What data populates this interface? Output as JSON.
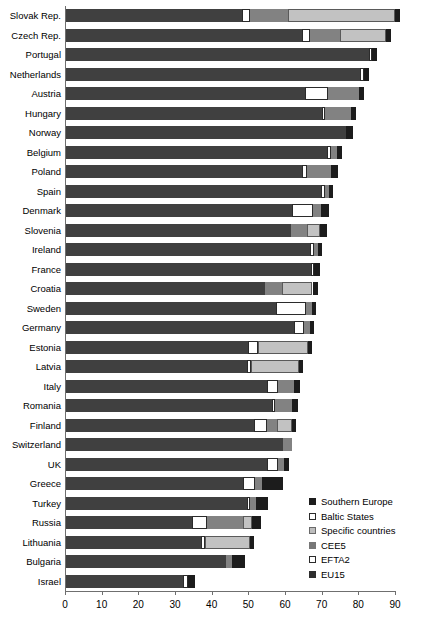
{
  "chart_data": {
    "type": "bar",
    "orientation": "horizontal",
    "stacked": true,
    "title": "",
    "xlabel": "",
    "ylabel": "",
    "xlim": [
      0,
      90
    ],
    "xticks": [
      0,
      10,
      20,
      30,
      40,
      50,
      60,
      70,
      80,
      90
    ],
    "grid": false,
    "legend_position": "inside-bottom-right",
    "series": [
      {
        "name": "EU15",
        "key": "EU15",
        "color": "#404040"
      },
      {
        "name": "EFTA2",
        "key": "EFTA2",
        "color": "#ffffff"
      },
      {
        "name": "CEE5",
        "key": "CEE5",
        "color": "#828282"
      },
      {
        "name": "Specific countries",
        "key": "specific",
        "color": "#c2c2c2"
      },
      {
        "name": "Baltic States",
        "key": "baltic",
        "color": "#ffffff"
      },
      {
        "name": "Southern Europe",
        "key": "southern",
        "color": "#1c1c1c"
      }
    ],
    "categories": [
      "Slovak Rep.",
      "Czech Rep.",
      "Portugal",
      "Netherlands",
      "Austria",
      "Hungary",
      "Norway",
      "Belgium",
      "Poland",
      "Spain",
      "Denmark",
      "Slovenia",
      "Ireland",
      "France",
      "Croatia",
      "Sweden",
      "Germany",
      "Estonia",
      "Latvia",
      "Italy",
      "Romania",
      "Finland",
      "Switzerland",
      "UK",
      "Greece",
      "Turkey",
      "Russia",
      "Lithuania",
      "Bulgaria",
      "Israel"
    ],
    "rows": [
      {
        "category": "Slovak Rep.",
        "total": 91.5,
        "segments": [
          {
            "key": "EU15",
            "value": 48.3
          },
          {
            "key": "EFTA2",
            "value": 2.2
          },
          {
            "key": "CEE5",
            "value": 10.4
          },
          {
            "key": "specific",
            "value": 29.2
          },
          {
            "key": "southern",
            "value": 1.4
          }
        ]
      },
      {
        "category": "Czech Rep.",
        "total": 89.0,
        "segments": [
          {
            "key": "EU15",
            "value": 64.6
          },
          {
            "key": "EFTA2",
            "value": 2.2
          },
          {
            "key": "CEE5",
            "value": 8.2
          },
          {
            "key": "specific",
            "value": 12.6
          },
          {
            "key": "southern",
            "value": 1.4
          }
        ]
      },
      {
        "category": "Portugal",
        "total": 85.0,
        "segments": [
          {
            "key": "EU15",
            "value": 83.0
          },
          {
            "key": "EFTA2",
            "value": 0.8
          },
          {
            "key": "southern",
            "value": 1.2
          }
        ]
      },
      {
        "category": "Netherlands",
        "total": 83.0,
        "segments": [
          {
            "key": "EU15",
            "value": 80.5
          },
          {
            "key": "EFTA2",
            "value": 1.1
          },
          {
            "key": "southern",
            "value": 1.4
          }
        ]
      },
      {
        "category": "Austria",
        "total": 81.5,
        "segments": [
          {
            "key": "EU15",
            "value": 65.5
          },
          {
            "key": "EFTA2",
            "value": 6.3
          },
          {
            "key": "CEE5",
            "value": 8.3
          },
          {
            "key": "southern",
            "value": 1.4
          }
        ]
      },
      {
        "category": "Hungary",
        "total": 79.5,
        "segments": [
          {
            "key": "EU15",
            "value": 70.0
          },
          {
            "key": "EFTA2",
            "value": 1.0
          },
          {
            "key": "CEE5",
            "value": 7.1
          },
          {
            "key": "southern",
            "value": 1.4
          }
        ]
      },
      {
        "category": "Norway",
        "total": 78.5,
        "segments": [
          {
            "key": "EU15",
            "value": 76.5
          },
          {
            "key": "southern",
            "value": 2.0
          }
        ]
      },
      {
        "category": "Belgium",
        "total": 75.5,
        "segments": [
          {
            "key": "EU15",
            "value": 71.5
          },
          {
            "key": "EFTA2",
            "value": 1.1
          },
          {
            "key": "CEE5",
            "value": 1.6
          },
          {
            "key": "southern",
            "value": 1.3
          }
        ]
      },
      {
        "category": "Poland",
        "total": 74.5,
        "segments": [
          {
            "key": "EU15",
            "value": 64.6
          },
          {
            "key": "EFTA2",
            "value": 1.4
          },
          {
            "key": "CEE5",
            "value": 6.5
          },
          {
            "key": "southern",
            "value": 2.0
          }
        ]
      },
      {
        "category": "Spain",
        "total": 73.0,
        "segments": [
          {
            "key": "EU15",
            "value": 69.8
          },
          {
            "key": "EFTA2",
            "value": 1.1
          },
          {
            "key": "CEE5",
            "value": 1.0
          },
          {
            "key": "southern",
            "value": 1.1
          }
        ]
      },
      {
        "category": "Denmark",
        "total": 72.0,
        "segments": [
          {
            "key": "EU15",
            "value": 62.0
          },
          {
            "key": "EFTA2",
            "value": 5.6
          },
          {
            "key": "CEE5",
            "value": 2.3
          },
          {
            "key": "southern",
            "value": 2.1
          }
        ]
      },
      {
        "category": "Slovenia",
        "total": 71.5,
        "segments": [
          {
            "key": "EU15",
            "value": 61.5
          },
          {
            "key": "CEE5",
            "value": 4.6
          },
          {
            "key": "specific",
            "value": 3.5
          },
          {
            "key": "southern",
            "value": 1.9
          }
        ]
      },
      {
        "category": "Ireland",
        "total": 70.0,
        "segments": [
          {
            "key": "EU15",
            "value": 66.8
          },
          {
            "key": "EFTA2",
            "value": 1.1
          },
          {
            "key": "CEE5",
            "value": 1.0
          },
          {
            "key": "southern",
            "value": 1.1
          }
        ]
      },
      {
        "category": "France",
        "total": 69.5,
        "segments": [
          {
            "key": "EU15",
            "value": 67.0
          },
          {
            "key": "EFTA2",
            "value": 1.0
          },
          {
            "key": "southern",
            "value": 1.5
          }
        ]
      },
      {
        "category": "Croatia",
        "total": 69.0,
        "segments": [
          {
            "key": "EU15",
            "value": 54.5
          },
          {
            "key": "CEE5",
            "value": 4.7
          },
          {
            "key": "specific",
            "value": 8.3
          },
          {
            "key": "southern",
            "value": 1.5
          }
        ]
      },
      {
        "category": "Sweden",
        "total": 68.5,
        "segments": [
          {
            "key": "EU15",
            "value": 57.5
          },
          {
            "key": "EFTA2",
            "value": 8.1
          },
          {
            "key": "CEE5",
            "value": 1.7
          },
          {
            "key": "southern",
            "value": 1.2
          }
        ]
      },
      {
        "category": "Germany",
        "total": 68.0,
        "segments": [
          {
            "key": "EU15",
            "value": 62.5
          },
          {
            "key": "EFTA2",
            "value": 2.6
          },
          {
            "key": "CEE5",
            "value": 1.7
          },
          {
            "key": "southern",
            "value": 1.2
          }
        ]
      },
      {
        "category": "Estonia",
        "total": 67.5,
        "segments": [
          {
            "key": "EU15",
            "value": 50.0
          },
          {
            "key": "baltic",
            "value": 2.6
          },
          {
            "key": "specific",
            "value": 13.8
          },
          {
            "key": "southern",
            "value": 1.1
          }
        ]
      },
      {
        "category": "Latvia",
        "total": 65.0,
        "segments": [
          {
            "key": "EU15",
            "value": 49.5
          },
          {
            "key": "baltic",
            "value": 1.3
          },
          {
            "key": "specific",
            "value": 13.0
          },
          {
            "key": "southern",
            "value": 1.2
          }
        ]
      },
      {
        "category": "Italy",
        "total": 64.0,
        "segments": [
          {
            "key": "EU15",
            "value": 55.0
          },
          {
            "key": "EFTA2",
            "value": 3.2
          },
          {
            "key": "CEE5",
            "value": 4.3
          },
          {
            "key": "southern",
            "value": 1.5
          }
        ]
      },
      {
        "category": "Romania",
        "total": 63.5,
        "segments": [
          {
            "key": "EU15",
            "value": 56.5
          },
          {
            "key": "EFTA2",
            "value": 0.9
          },
          {
            "key": "CEE5",
            "value": 4.5
          },
          {
            "key": "southern",
            "value": 1.6
          }
        ]
      },
      {
        "category": "Finland",
        "total": 63.0,
        "segments": [
          {
            "key": "EU15",
            "value": 51.5
          },
          {
            "key": "EFTA2",
            "value": 3.5
          },
          {
            "key": "CEE5",
            "value": 2.9
          },
          {
            "key": "specific",
            "value": 4.0
          },
          {
            "key": "southern",
            "value": 1.1
          }
        ]
      },
      {
        "category": "Switzerland",
        "total": 62.0,
        "segments": [
          {
            "key": "EU15",
            "value": 59.5
          },
          {
            "key": "CEE5",
            "value": 2.5
          }
        ]
      },
      {
        "category": "UK",
        "total": 61.0,
        "segments": [
          {
            "key": "EU15",
            "value": 55.0
          },
          {
            "key": "EFTA2",
            "value": 3.0
          },
          {
            "key": "CEE5",
            "value": 1.6
          },
          {
            "key": "southern",
            "value": 1.4
          }
        ]
      },
      {
        "category": "Greece",
        "total": 59.5,
        "segments": [
          {
            "key": "EU15",
            "value": 48.5
          },
          {
            "key": "EFTA2",
            "value": 3.4
          },
          {
            "key": "CEE5",
            "value": 1.9
          },
          {
            "key": "southern",
            "value": 5.7
          }
        ]
      },
      {
        "category": "Turkey",
        "total": 55.5,
        "segments": [
          {
            "key": "EU15",
            "value": 49.5
          },
          {
            "key": "EFTA2",
            "value": 1.0
          },
          {
            "key": "CEE5",
            "value": 1.6
          },
          {
            "key": "southern",
            "value": 3.4
          }
        ]
      },
      {
        "category": "Russia",
        "total": 53.5,
        "segments": [
          {
            "key": "EU15",
            "value": 34.5
          },
          {
            "key": "baltic",
            "value": 4.1
          },
          {
            "key": "CEE5",
            "value": 10.0
          },
          {
            "key": "specific",
            "value": 2.5
          },
          {
            "key": "southern",
            "value": 2.4
          }
        ]
      },
      {
        "category": "Lithuania",
        "total": 51.5,
        "segments": [
          {
            "key": "EU15",
            "value": 37.0
          },
          {
            "key": "baltic",
            "value": 1.2
          },
          {
            "key": "specific",
            "value": 12.2
          },
          {
            "key": "southern",
            "value": 1.1
          }
        ]
      },
      {
        "category": "Bulgaria",
        "total": 49.0,
        "segments": [
          {
            "key": "EU15",
            "value": 44.0
          },
          {
            "key": "CEE5",
            "value": 1.5
          },
          {
            "key": "southern",
            "value": 3.5
          }
        ]
      },
      {
        "category": "Israel",
        "total": 35.5,
        "segments": [
          {
            "key": "EU15",
            "value": 32.2
          },
          {
            "key": "EFTA2",
            "value": 1.3
          },
          {
            "key": "southern",
            "value": 2.0
          }
        ]
      }
    ],
    "legend": [
      {
        "label": "Southern Europe",
        "key": "southern"
      },
      {
        "label": "Baltic States",
        "key": "baltic"
      },
      {
        "label": "Specific countries",
        "key": "specific"
      },
      {
        "label": "CEE5",
        "key": "CEE5"
      },
      {
        "label": "EFTA2",
        "key": "EFTA2"
      },
      {
        "label": "EU15",
        "key": "EU15"
      }
    ]
  }
}
